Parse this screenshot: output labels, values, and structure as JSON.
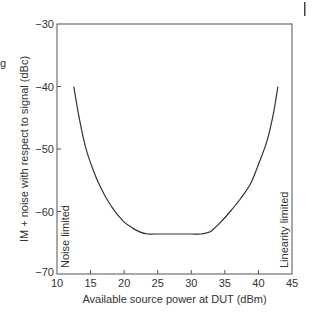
{
  "chart_data": {
    "type": "line",
    "title": "",
    "xlabel": "Available source power at DUT (dBm)",
    "ylabel": "IM + noise with respect to signal (dBc)",
    "xlim": [
      10,
      45
    ],
    "ylim": [
      -70,
      -30
    ],
    "xticks": [
      10,
      15,
      20,
      25,
      30,
      35,
      40,
      45
    ],
    "yticks": [
      -70,
      -60,
      -50,
      -40,
      -30
    ],
    "xtick_labels": [
      "10",
      "15",
      "20",
      "25",
      "30",
      "35",
      "40",
      "45"
    ],
    "ytick_labels": [
      "−70",
      "−60",
      "−50",
      "−40",
      "−30"
    ],
    "grid": false,
    "legend": null,
    "series": [
      {
        "name": "IM + noise",
        "color": "#333333",
        "x": [
          12.5,
          13.3,
          14.3,
          15.2,
          16.0,
          17.0,
          18.0,
          19.0,
          20.0,
          21.2,
          22.4,
          23.5,
          24.5,
          26.0,
          28.0,
          30.0,
          31.5,
          32.3,
          33.0,
          34.3,
          35.8,
          37.3,
          38.8,
          40.0,
          41.3,
          42.2,
          42.9
        ],
        "y": [
          -40.0,
          -45.0,
          -49.9,
          -52.8,
          -55.0,
          -57.2,
          -59.0,
          -60.5,
          -61.7,
          -62.6,
          -63.3,
          -63.6,
          -63.6,
          -63.6,
          -63.6,
          -63.6,
          -63.6,
          -63.4,
          -63.1,
          -61.8,
          -60.0,
          -58.0,
          -55.6,
          -52.5,
          -48.6,
          -44.5,
          -40.0
        ]
      }
    ],
    "annotations": [
      {
        "text": "Noise limited",
        "x": 11.3,
        "y": -69,
        "rotation": -90
      },
      {
        "text": "Linearity limited",
        "x": 44.0,
        "y": -69,
        "rotation": -90
      }
    ]
  }
}
